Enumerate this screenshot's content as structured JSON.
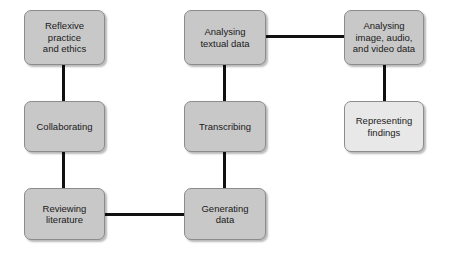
{
  "diagram": {
    "canvas": {
      "width": 454,
      "height": 254,
      "background": "#ffffff"
    },
    "styles": {
      "node_fill_primary": "#c8c8c8",
      "node_fill_secondary": "#e8e8e8",
      "node_border": "#8c8c8c",
      "connector_color": "#111111",
      "text_color": "#1a1a1a"
    },
    "nodes": [
      {
        "id": "reflexive-practice-and-ethics",
        "label": "Reflexive\npractice\nand ethics",
        "fill": "#c8c8c8",
        "x": 24,
        "y": 10,
        "w": 81,
        "h": 55
      },
      {
        "id": "analysing-textual-data",
        "label": "Analysing\ntextual data",
        "fill": "#c8c8c8",
        "x": 184,
        "y": 10,
        "w": 82,
        "h": 55
      },
      {
        "id": "analysing-image-audio-and-video-data",
        "label": "Analysing\nimage, audio,\nand video data",
        "fill": "#c8c8c8",
        "x": 344,
        "y": 10,
        "w": 80,
        "h": 55
      },
      {
        "id": "collaborating",
        "label": "Collaborating",
        "fill": "#c8c8c8",
        "x": 24,
        "y": 101,
        "w": 81,
        "h": 51
      },
      {
        "id": "transcribing",
        "label": "Transcribing",
        "fill": "#c8c8c8",
        "x": 184,
        "y": 101,
        "w": 82,
        "h": 51
      },
      {
        "id": "representing-findings",
        "label": "Representing\nfindings",
        "fill": "#e8e8e8",
        "x": 344,
        "y": 101,
        "w": 80,
        "h": 51
      },
      {
        "id": "reviewing-literature",
        "label": "Reviewing\nliterature",
        "fill": "#c8c8c8",
        "x": 24,
        "y": 188,
        "w": 81,
        "h": 52
      },
      {
        "id": "generating-data",
        "label": "Generating\ndata",
        "fill": "#c8c8c8",
        "x": 184,
        "y": 188,
        "w": 82,
        "h": 52
      }
    ],
    "connectors": [
      {
        "id": "reflexive-to-collaborating",
        "from": "reflexive-practice-and-ethics",
        "to": "collaborating",
        "orientation": "vertical",
        "x": 62,
        "y": 64,
        "w": 3,
        "h": 38
      },
      {
        "id": "collaborating-to-reviewing-literature",
        "from": "collaborating",
        "to": "reviewing-literature",
        "orientation": "vertical",
        "x": 62,
        "y": 151,
        "w": 3,
        "h": 38
      },
      {
        "id": "analysing-textual-to-transcribing",
        "from": "analysing-textual-data",
        "to": "transcribing",
        "orientation": "vertical",
        "x": 223,
        "y": 64,
        "w": 3,
        "h": 38
      },
      {
        "id": "transcribing-to-generating-data",
        "from": "transcribing",
        "to": "generating-data",
        "orientation": "vertical",
        "x": 223,
        "y": 151,
        "w": 3,
        "h": 38
      },
      {
        "id": "analysing-image-to-representing-findings",
        "from": "analysing-image-audio-and-video-data",
        "to": "representing-findings",
        "orientation": "vertical",
        "x": 383,
        "y": 64,
        "w": 3,
        "h": 38
      },
      {
        "id": "analysing-textual-to-analysing-image",
        "from": "analysing-textual-data",
        "to": "analysing-image-audio-and-video-data",
        "orientation": "horizontal",
        "x": 265,
        "y": 35,
        "w": 80,
        "h": 3
      },
      {
        "id": "reviewing-literature-to-generating-data",
        "from": "reviewing-literature",
        "to": "generating-data",
        "orientation": "horizontal",
        "x": 104,
        "y": 213,
        "w": 81,
        "h": 3
      }
    ]
  }
}
